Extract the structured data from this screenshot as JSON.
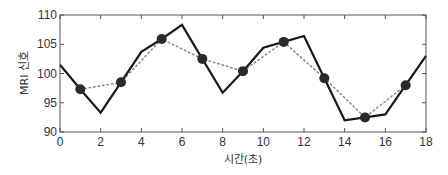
{
  "chart_data": {
    "type": "line",
    "title": "",
    "xlabel": "시간(초)",
    "ylabel": "MRI 신호",
    "xlim": [
      0,
      18
    ],
    "ylim": [
      90,
      110
    ],
    "x_ticks": [
      0,
      2,
      4,
      6,
      8,
      10,
      12,
      14,
      16,
      18
    ],
    "y_ticks": [
      90,
      95,
      100,
      105,
      110
    ],
    "grid": false,
    "legend": null,
    "series": [
      {
        "name": "signal",
        "style": "solid",
        "color": "#1a1a1a",
        "x": [
          0,
          1,
          2,
          3,
          4,
          5,
          6,
          7,
          8,
          9,
          10,
          11,
          12,
          13,
          14,
          15,
          16,
          17,
          18
        ],
        "values": [
          101.5,
          97.3,
          93.3,
          98.5,
          103.7,
          105.9,
          108.3,
          102.5,
          96.7,
          100.4,
          104.4,
          105.4,
          106.4,
          99.2,
          92.0,
          92.5,
          93.0,
          98.0,
          103.0
        ]
      },
      {
        "name": "sampled",
        "style": "dotted-with-markers",
        "color": "#888888",
        "marker_color": "#2a2a2a",
        "x": [
          1,
          3,
          5,
          7,
          9,
          11,
          13,
          15,
          17
        ],
        "values": [
          97.3,
          98.5,
          105.9,
          102.5,
          100.4,
          105.4,
          99.2,
          92.5,
          98.0
        ]
      }
    ]
  }
}
